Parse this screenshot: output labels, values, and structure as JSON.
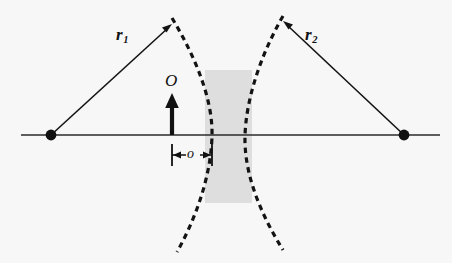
{
  "figure": {
    "name": "thin-diverging-lens-ray-diagram",
    "background_color": "#f7f7f7",
    "stroke_color": "#111111",
    "lens_fill_color": "#dedede",
    "labels": {
      "r1_base": "r",
      "r1_sub": "1",
      "r2_base": "r",
      "r2_sub": "2",
      "object_height": "O",
      "object_distance": "o"
    },
    "axis": {
      "label": "optical-axis",
      "y": 135,
      "x_start": 21,
      "x_end": 440
    },
    "points": [
      {
        "name": "left-focus-point",
        "x": 51,
        "y": 135
      },
      {
        "name": "right-focus-point",
        "x": 404,
        "y": 135
      }
    ],
    "rays": [
      {
        "name": "ray-r1",
        "from_x": 51,
        "from_y": 135,
        "to_x": 172,
        "to_y": 25
      },
      {
        "name": "ray-r2",
        "from_x": 404,
        "from_y": 135,
        "to_x": 283,
        "to_y": 22
      }
    ],
    "object_arrow": {
      "x": 172,
      "base_y": 135,
      "tip_y": 94
    },
    "dimension": {
      "from_x": 172,
      "to_x": 212,
      "y": 155
    },
    "lens_rect": {
      "x": 205,
      "y": 70,
      "width": 47,
      "height": 133
    },
    "curves": [
      {
        "name": "left-lens-surface",
        "top_x": 172,
        "top_y": 18,
        "mid_x": 212,
        "mid_y": 135,
        "bottom_x": 177,
        "bottom_y": 252
      },
      {
        "name": "right-lens-surface",
        "top_x": 283,
        "top_y": 16,
        "mid_x": 245,
        "mid_y": 135,
        "bottom_x": 283,
        "bottom_y": 250
      }
    ]
  }
}
